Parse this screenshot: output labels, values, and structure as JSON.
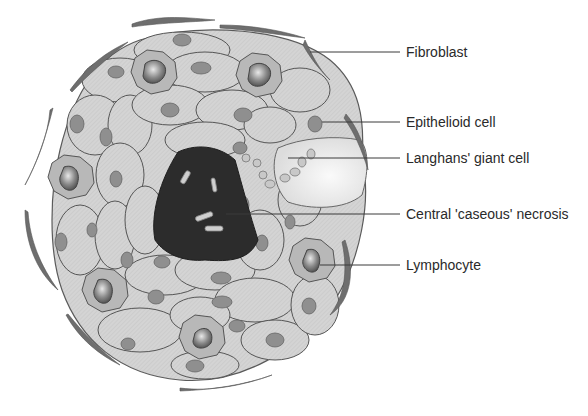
{
  "figure": {
    "colors": {
      "cell_fill": "#d6d6d6",
      "cell_stroke": "#5a5a5a",
      "nucleus": "#8f8f8f",
      "necrosis": "#2c2c2c",
      "giant_cell": "#ededed",
      "fibroblast": "#6e6e6e",
      "leader_line": "#3a3a3a"
    }
  },
  "labels": [
    {
      "id": "fibroblast",
      "text": "Fibroblast"
    },
    {
      "id": "epithelioid",
      "text": "Epithelioid cell"
    },
    {
      "id": "langhans",
      "text": "Langhans' giant cell"
    },
    {
      "id": "necrosis",
      "text": "Central 'caseous' necrosis"
    },
    {
      "id": "lymphocyte",
      "text": "Lymphocyte"
    }
  ]
}
